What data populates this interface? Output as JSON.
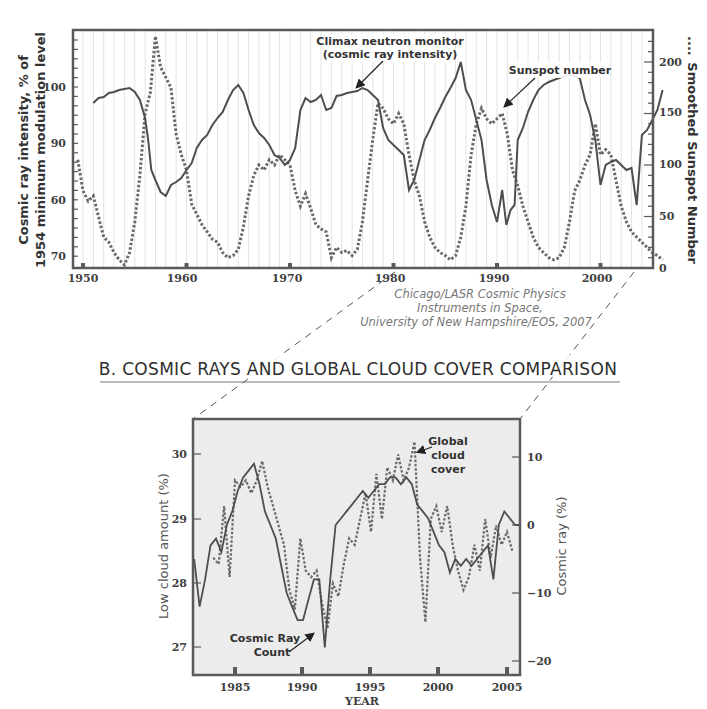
{
  "chart_data": [
    {
      "type": "line",
      "title": "",
      "xlabel": "",
      "ylabel": "Cosmic ray intensity, % of 1954 minimum modulation level",
      "y2label": "Smoothed Sunspot Number",
      "x_ticks": [
        "1950",
        "1960",
        "1970",
        "1980",
        "1990",
        "2000"
      ],
      "xlim": [
        1949,
        2006
      ],
      "y_ticks": [
        "100",
        "90",
        "60",
        "70"
      ],
      "y2_ticks": [
        "200",
        "150",
        "100",
        "50",
        "0"
      ],
      "y2lim": [
        0,
        230
      ],
      "grid": "vertical",
      "annotations": [
        "Climax neutron monitor",
        "(cosmic ray intensity)",
        "Sunspot number"
      ],
      "series": [
        {
          "name": "Climax neutron monitor (cosmic ray intensity)",
          "style": "solid",
          "axis": "left",
          "x": [
            1951.0,
            1951.5,
            1952.0,
            1952.5,
            1953.0,
            1953.5,
            1954.0,
            1954.5,
            1955.0,
            1955.5,
            1956.0,
            1956.3,
            1956.6,
            1957.0,
            1957.5,
            1958.0,
            1958.5,
            1959.0,
            1959.5,
            1960.0,
            1960.5,
            1961.0,
            1961.5,
            1962.0,
            1962.5,
            1963.0,
            1963.5,
            1964.0,
            1964.5,
            1965.0,
            1965.5,
            1966.0,
            1966.5,
            1967.0,
            1967.5,
            1968.0,
            1968.5,
            1969.0,
            1969.5,
            1970.0,
            1970.5,
            1971.0,
            1971.5,
            1972.0,
            1972.5,
            1973.0,
            1973.5,
            1974.0,
            1974.5,
            1975.0,
            1975.5,
            1976.0,
            1976.5,
            1977.0,
            1977.5,
            1978.0,
            1978.5,
            1979.0,
            1979.5,
            1980.0,
            1980.5,
            1981.0,
            1981.5,
            1982.0,
            1982.5,
            1983.0,
            1983.5,
            1984.0,
            1984.5,
            1985.0,
            1985.5,
            1986.0,
            1986.5,
            1987.0,
            1987.5,
            1988.0,
            1988.5,
            1989.0,
            1989.5,
            1990.0,
            1990.5,
            1990.9,
            1991.3,
            1991.7,
            1992.0,
            1992.5,
            1993.0,
            1993.5,
            1994.0,
            1994.5,
            1995.0,
            1995.5,
            1996.0,
            1996.5,
            1997.0,
            1997.5,
            1998.0,
            1998.5,
            1999.0,
            1999.5,
            2000.0,
            2000.5,
            2001.0,
            2001.5,
            2002.0,
            2002.5,
            2003.0,
            2003.5,
            2004.0,
            2004.5,
            2005.0,
            2005.5,
            2006.0
          ],
          "y_px": [
            103,
            98,
            97,
            93,
            92,
            90,
            89,
            88,
            92,
            100,
            118,
            140,
            170,
            180,
            192,
            196,
            185,
            182,
            178,
            170,
            163,
            148,
            140,
            135,
            125,
            118,
            112,
            100,
            90,
            85,
            93,
            110,
            125,
            133,
            138,
            145,
            155,
            158,
            165,
            160,
            148,
            110,
            98,
            102,
            100,
            95,
            110,
            108,
            96,
            95,
            93,
            92,
            91,
            88,
            90,
            95,
            100,
            128,
            140,
            145,
            150,
            155,
            190,
            180,
            160,
            140,
            130,
            118,
            108,
            97,
            88,
            78,
            62,
            90,
            100,
            120,
            140,
            180,
            205,
            222,
            190,
            225,
            210,
            205,
            140,
            128,
            112,
            100,
            90,
            85,
            82,
            80,
            78,
            76,
            75,
            76,
            78,
            100,
            115,
            140,
            185,
            165,
            162,
            160,
            165,
            170,
            168,
            205,
            135,
            130,
            120,
            110,
            90
          ]
        },
        {
          "name": "Smoothed Sunspot Number",
          "style": "dotted",
          "axis": "right",
          "x": [
            1949.5,
            1950.0,
            1950.5,
            1951.0,
            1951.5,
            1952.0,
            1952.5,
            1953.0,
            1953.5,
            1954.0,
            1954.5,
            1955.0,
            1955.5,
            1956.0,
            1956.5,
            1957.0,
            1957.5,
            1958.0,
            1958.5,
            1959.0,
            1959.5,
            1960.0,
            1960.5,
            1961.0,
            1961.5,
            1962.0,
            1962.5,
            1963.0,
            1963.5,
            1964.0,
            1964.5,
            1965.0,
            1965.5,
            1966.0,
            1966.5,
            1967.0,
            1967.5,
            1968.0,
            1968.5,
            1969.0,
            1969.5,
            1970.0,
            1970.5,
            1971.0,
            1971.5,
            1972.0,
            1972.5,
            1973.0,
            1973.5,
            1974.0,
            1974.5,
            1975.0,
            1975.5,
            1976.0,
            1976.5,
            1977.0,
            1977.5,
            1978.0,
            1978.5,
            1979.0,
            1979.5,
            1980.0,
            1980.5,
            1981.0,
            1981.5,
            1982.0,
            1982.5,
            1983.0,
            1983.5,
            1984.0,
            1984.5,
            1985.0,
            1985.5,
            1986.0,
            1986.5,
            1987.0,
            1987.5,
            1988.0,
            1988.5,
            1989.0,
            1989.5,
            1990.0,
            1990.5,
            1991.0,
            1991.5,
            1992.0,
            1992.5,
            1993.0,
            1993.5,
            1994.0,
            1994.5,
            1995.0,
            1995.5,
            1996.0,
            1996.5,
            1997.0,
            1997.5,
            1998.0,
            1998.5,
            1999.0,
            1999.5,
            2000.0,
            2000.5,
            2001.0,
            2001.5,
            2002.0,
            2002.5,
            2003.0,
            2003.5,
            2004.0,
            2004.5,
            2005.0,
            2005.5,
            2006.0
          ],
          "values": [
            105,
            75,
            65,
            70,
            50,
            30,
            25,
            15,
            8,
            3,
            15,
            45,
            90,
            150,
            170,
            225,
            195,
            185,
            175,
            130,
            110,
            95,
            62,
            52,
            42,
            35,
            28,
            25,
            15,
            10,
            12,
            18,
            40,
            70,
            90,
            100,
            95,
            105,
            100,
            110,
            105,
            100,
            75,
            60,
            72,
            58,
            42,
            38,
            35,
            10,
            20,
            15,
            17,
            12,
            18,
            45,
            85,
            125,
            160,
            155,
            145,
            140,
            150,
            140,
            110,
            85,
            70,
            45,
            30,
            20,
            15,
            12,
            8,
            12,
            30,
            60,
            110,
            140,
            155,
            145,
            140,
            145,
            150,
            130,
            95,
            80,
            60,
            45,
            30,
            20,
            15,
            10,
            8,
            10,
            20,
            45,
            75,
            85,
            100,
            110,
            140,
            110,
            115,
            110,
            85,
            60,
            45,
            35,
            30,
            25,
            20,
            15,
            12,
            8
          ]
        }
      ]
    },
    {
      "type": "line",
      "title": "B. COSMIC RAYS AND GLOBAL CLOUD COVER COMPARISON",
      "xlabel": "YEAR",
      "ylabel": "Low cloud amount (%)",
      "y2label": "Cosmic ray (%)",
      "x_ticks": [
        "1985",
        "1990",
        "1995",
        "2000",
        "2005"
      ],
      "xlim": [
        1982,
        2006
      ],
      "y_ticks": [
        "30",
        "29",
        "28",
        "27"
      ],
      "ylim": [
        26.6,
        30.5
      ],
      "y2_ticks": [
        "10",
        "0",
        "-10",
        "-20"
      ],
      "y2lim": [
        -23,
        15
      ],
      "annotations": [
        "Global cloud cover",
        "Cosmic Ray Count"
      ],
      "series": [
        {
          "name": "Cosmic Ray Count",
          "style": "solid",
          "axis": "right",
          "x": [
            1982.0,
            1982.4,
            1982.8,
            1983.2,
            1983.6,
            1984.0,
            1984.4,
            1984.8,
            1985.2,
            1985.6,
            1986.0,
            1986.4,
            1986.8,
            1987.2,
            1987.6,
            1988.0,
            1988.4,
            1988.8,
            1989.2,
            1989.6,
            1990.0,
            1990.4,
            1990.8,
            1991.2,
            1991.6,
            1992.0,
            1992.4,
            1992.8,
            1993.2,
            1993.6,
            1994.0,
            1994.4,
            1994.8,
            1995.2,
            1995.6,
            1996.0,
            1996.4,
            1996.8,
            1997.2,
            1997.6,
            1998.0,
            1998.4,
            1998.8,
            1999.2,
            1999.6,
            2000.0,
            2000.4,
            2000.8,
            2001.2,
            2001.6,
            2002.0,
            2002.4,
            2002.8,
            2003.2,
            2003.6,
            2004.0,
            2004.4,
            2004.8,
            2005.2,
            2005.6,
            2006.0
          ],
          "values": [
            -5,
            -12,
            -8,
            -3,
            -2,
            -4,
            0,
            2,
            5,
            7,
            8,
            9,
            6,
            2,
            0,
            -2,
            -6,
            -10,
            -12,
            -14,
            -14,
            -11,
            -8,
            -8,
            -18,
            -8,
            0,
            1,
            2,
            3,
            4,
            5,
            4,
            5,
            6,
            6,
            7,
            7,
            6,
            7,
            6,
            3,
            2,
            1,
            -1,
            -3,
            -4,
            -7,
            -5,
            -6,
            -5,
            -6,
            -5,
            -4,
            -3,
            -8,
            0,
            2,
            1,
            0,
            0
          ],
          "approx_low_cloud_equiv": true
        },
        {
          "name": "Global cloud cover",
          "style": "dotted",
          "axis": "left",
          "x": [
            1983.4,
            1983.8,
            1984.2,
            1984.6,
            1985.0,
            1985.4,
            1985.8,
            1986.2,
            1986.6,
            1987.0,
            1987.4,
            1987.8,
            1988.2,
            1988.6,
            1989.0,
            1989.4,
            1989.8,
            1990.2,
            1990.6,
            1991.0,
            1991.4,
            1991.8,
            1992.2,
            1992.6,
            1993.0,
            1993.4,
            1993.8,
            1994.2,
            1994.6,
            1995.0,
            1995.4,
            1995.8,
            1996.2,
            1996.6,
            1997.0,
            1997.4,
            1997.8,
            1998.2,
            1998.6,
            1999.0,
            1999.4,
            1999.8,
            2000.2,
            2000.6,
            2001.0,
            2001.4,
            2001.8,
            2002.2,
            2002.6,
            2003.0,
            2003.4,
            2003.8,
            2004.2,
            2004.6,
            2005.0,
            2005.4
          ],
          "values": [
            28.4,
            28.3,
            29.2,
            28.1,
            29.6,
            29.5,
            29.6,
            29.4,
            29.6,
            29.9,
            29.5,
            29.2,
            28.9,
            28.6,
            27.9,
            27.6,
            28.7,
            28.2,
            28.1,
            28.2,
            27.7,
            27.3,
            28.0,
            27.8,
            28.3,
            28.7,
            28.6,
            29.0,
            29.4,
            28.8,
            29.7,
            29.0,
            29.8,
            29.6,
            30.0,
            29.6,
            29.8,
            30.2,
            28.4,
            27.4,
            29.0,
            29.2,
            28.8,
            29.2,
            28.6,
            28.2,
            27.9,
            28.1,
            28.6,
            28.2,
            29.0,
            28.4,
            28.9,
            28.6,
            28.8,
            28.5
          ]
        }
      ]
    }
  ],
  "top_chart": {
    "y_left_title_line1": "Cosmic ray intensity, % of",
    "y_left_title_line2": "1954 minimum modulation level",
    "y_right_title": "Smoothed Sunspot Number",
    "y_right_legend_marker": "....",
    "left_ticks": [
      "100",
      "90",
      "60",
      "70"
    ],
    "right_ticks": [
      "200",
      "150",
      "100",
      "50",
      "0"
    ],
    "x_ticks": [
      "1950",
      "1960",
      "1970",
      "1980",
      "1990",
      "2000"
    ],
    "annotation_neutron_line1": "Climax neutron monitor",
    "annotation_neutron_line2": "(cosmic ray intensity)",
    "annotation_sunspot": "Sunspot number",
    "credit_line1": "Chicago/LASR Cosmic Physics",
    "credit_line2": "Instruments in Space,",
    "credit_line3": "University of New Hampshire/EOS, 2007"
  },
  "section_b": {
    "title": "B. COSMIC RAYS AND GLOBAL CLOUD COVER COMPARISON"
  },
  "bottom_chart": {
    "y_left_title": "Low cloud amount (%)",
    "y_right_title": "Cosmic ray (%)",
    "x_title": "YEAR",
    "left_ticks": [
      "30",
      "29",
      "28",
      "27"
    ],
    "right_ticks": [
      "10",
      "0",
      "−10",
      "−20"
    ],
    "x_ticks": [
      "1985",
      "1990",
      "1995",
      "2000",
      "2005"
    ],
    "annotation_cloud_line1": "Global",
    "annotation_cloud_line2": "cloud",
    "annotation_cloud_line3": "cover",
    "annotation_cr_line1": "Cosmic Ray",
    "annotation_cr_line2": "Count"
  },
  "colors": {
    "line": "#555555",
    "frame": "#5a5a5a",
    "grid": "#d8d8d8",
    "bottom_bg": "#ececec",
    "credit": "#7a7a7a"
  }
}
